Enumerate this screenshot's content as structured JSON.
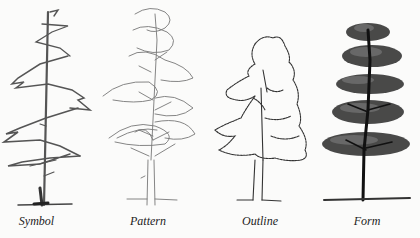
{
  "figure": {
    "panels": [
      {
        "label": "Symbol",
        "drawing": "symbol-tree"
      },
      {
        "label": "Pattern",
        "drawing": "pattern-tree"
      },
      {
        "label": "Outline",
        "drawing": "outline-tree"
      },
      {
        "label": "Form",
        "drawing": "form-tree"
      }
    ]
  }
}
